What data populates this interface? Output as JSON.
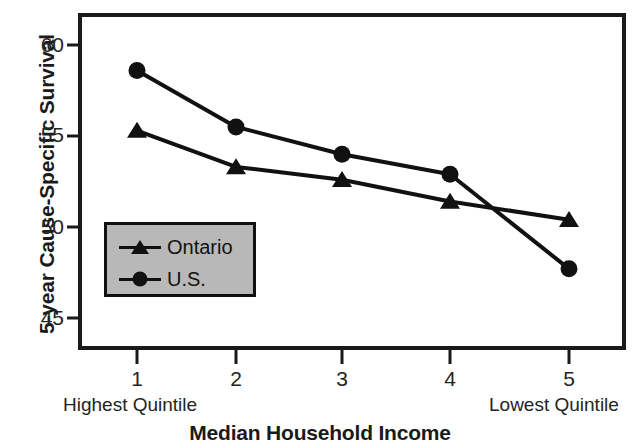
{
  "chart_data": {
    "type": "line",
    "title": "",
    "xlabel": "Median Household Income",
    "ylabel": "5-year Cause-Specific Survival",
    "categories": [
      "1",
      "2",
      "3",
      "4",
      "5"
    ],
    "x": [
      1,
      2,
      3,
      4,
      5
    ],
    "xlim": [
      0.55,
      5.55
    ],
    "ylim": [
      43.8,
      61.3
    ],
    "yticks": [
      45,
      50,
      55,
      60
    ],
    "xticks": [
      "1",
      "2",
      "3",
      "4",
      "5"
    ],
    "grid": false,
    "legend_position": "inside-lower-left",
    "series": [
      {
        "name": "Ontario",
        "marker": "triangle",
        "values": [
          55.3,
          53.3,
          52.6,
          51.4,
          50.4
        ]
      },
      {
        "name": "U.S.",
        "marker": "circle",
        "values": [
          58.6,
          55.5,
          54.0,
          52.9,
          47.7
        ]
      }
    ],
    "annotations": [
      {
        "text": "Highest Quintile",
        "near_tick": "1"
      },
      {
        "text": "Lowest Quintile",
        "near_tick": "5"
      }
    ],
    "colors": {
      "line": "#111111",
      "marker": "#111111",
      "axis": "#1a1a1a",
      "legend_background": "#b8b8b8",
      "legend_border": "#111111",
      "plot_background": "#ffffff"
    }
  },
  "axes": {
    "y_title": "5-year Cause-Specific Survival",
    "x_title": "Median Household Income",
    "y_tick_labels": [
      "60",
      "55",
      "50",
      "45"
    ],
    "x_tick_labels": [
      "1",
      "2",
      "3",
      "4",
      "5"
    ]
  },
  "annotations": {
    "highest": "Highest Quintile",
    "lowest": "Lowest Quintile"
  },
  "legend": {
    "entries": [
      {
        "label": "Ontario",
        "marker": "triangle-marker-icon"
      },
      {
        "label": "U.S.",
        "marker": "circle-marker-icon"
      }
    ]
  }
}
